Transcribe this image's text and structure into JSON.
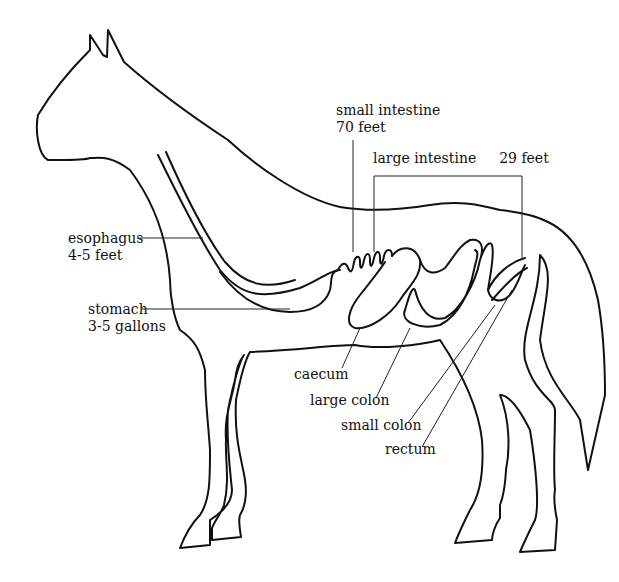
{
  "diagram": {
    "colors": {
      "line": "#111111",
      "background": "#ffffff"
    },
    "labels": {
      "small_intestine": {
        "name": "small intestine",
        "measure": "70 feet"
      },
      "large_intestine": {
        "name": "large intestine",
        "measure": "29 feet"
      },
      "esophagus": {
        "name": "esophagus",
        "measure": "4-5 feet"
      },
      "stomach": {
        "name": "stomach",
        "measure": "3-5 gallons"
      },
      "caecum": {
        "name": "caecum"
      },
      "large_colon": {
        "name": "large colon"
      },
      "small_colon": {
        "name": "small colon"
      },
      "rectum": {
        "name": "rectum"
      }
    }
  }
}
